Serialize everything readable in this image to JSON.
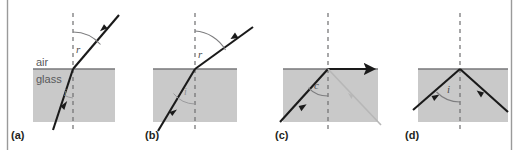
{
  "figure": {
    "border_color": "#9a9a9a",
    "glass_fill": "#c9c9c9",
    "glass_stroke": "#8a8a8a",
    "ray_color": "#1a1a1a",
    "normal_color": "#6e6e70",
    "faint_ray_color": "#b7b7b7",
    "background": "#ffffff"
  },
  "media": {
    "air_label": "air",
    "glass_label": "glass"
  },
  "panels": [
    {
      "id": "a",
      "label": "(a)",
      "caption_text": "(a)",
      "description": "Ray travelling from glass into air, refracted away from the normal; small angle of incidence i inside glass, larger angle of refraction r in air.",
      "angles": [
        {
          "name": "refraction-angle",
          "symbol": "r",
          "medium": "air",
          "faint": false
        },
        {
          "name": "incidence-angle",
          "symbol": "i",
          "medium": "glass",
          "faint": true
        }
      ]
    },
    {
      "id": "b",
      "label": "(b)",
      "caption_text": "(b)",
      "description": "Larger angle of incidence i in glass gives a much larger angle of refraction r in air.",
      "angles": [
        {
          "name": "refraction-angle",
          "symbol": "r",
          "medium": "air",
          "faint": false
        },
        {
          "name": "incidence-angle",
          "symbol": "i",
          "medium": "glass",
          "faint": true
        }
      ]
    },
    {
      "id": "c",
      "label": "(c)",
      "caption_text": "(c)",
      "description": "At the critical angle c the refracted ray travels along the boundary surface; a faint partially reflected ray returns into the glass.",
      "angles": [
        {
          "name": "critical-angle",
          "symbol": "c",
          "medium": "glass",
          "faint": false
        }
      ]
    },
    {
      "id": "d",
      "label": "(d)",
      "caption_text": "(d)",
      "description": "Beyond the critical angle the ray is totally internally reflected back into the glass at angle i.",
      "angles": [
        {
          "name": "incidence-angle",
          "symbol": "i",
          "medium": "glass",
          "faint": false
        }
      ]
    }
  ]
}
